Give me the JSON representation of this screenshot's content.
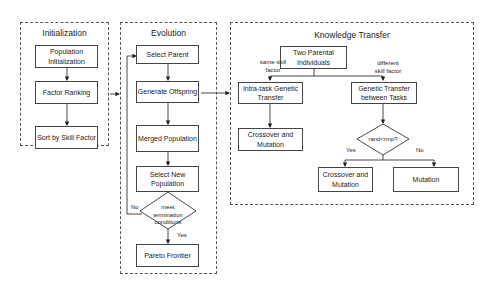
{
  "panels": {
    "initialization": {
      "title": "Initialization",
      "boxes": [
        "Population Initialization",
        "Factor Ranking",
        "Sort by Skill Factor"
      ]
    },
    "evolution": {
      "title": "Evolution",
      "boxes": [
        "Select Parent",
        "Generate Offspring",
        "Merged Population",
        "Select New Population",
        "Pareto Frontier"
      ],
      "decision": "meet termination conditions",
      "yes_label": "Yes",
      "no_label": "No"
    },
    "knowledge_transfer": {
      "title": "Knowledge Transfer",
      "boxes": {
        "parents": "Two Parental Individuals",
        "intra": "Intra-task Genetic Transfer",
        "inter": "Genetic Transfer between Tasks",
        "crossover_left": "Crossover and Mutation",
        "crossover_right": "Crossover and Mutation",
        "mutation": "Mutation"
      },
      "same_label": "same skill factor",
      "different_label": "different skill factor",
      "decision": "rand<rmp?",
      "yes_label": "Yes",
      "no_label": "No"
    }
  }
}
